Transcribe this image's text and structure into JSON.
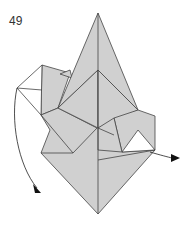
{
  "diagram": {
    "step_number": "49",
    "type": "origami fold diagram",
    "fill_color": "#d0d0d0",
    "line_color": "#444444",
    "arrows": [
      {
        "name": "left-swing-arrow",
        "direction": "down-left"
      },
      {
        "name": "right-pull-arrow",
        "direction": "right"
      }
    ]
  }
}
